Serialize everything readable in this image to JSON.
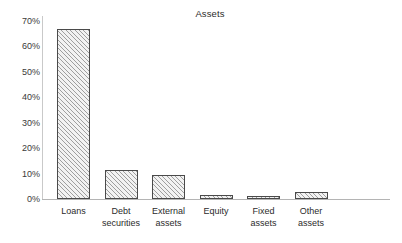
{
  "chart_data": {
    "type": "bar",
    "title": "Assets",
    "xlabel": "",
    "ylabel": "",
    "ylim": [
      0,
      70
    ],
    "ytick_labels": [
      "70%",
      "60%",
      "50%",
      "40%",
      "30%",
      "20%",
      "10%",
      "0%"
    ],
    "ytick_values": [
      70,
      60,
      50,
      40,
      30,
      20,
      10,
      0
    ],
    "grid": false,
    "legend": "none",
    "categories": [
      "Loans",
      "Debt securities",
      "External assets",
      "Equity",
      "Fixed assets",
      "Other assets"
    ],
    "category_lines": [
      [
        "Loans",
        ""
      ],
      [
        "Debt",
        "securities"
      ],
      [
        "External",
        "assets"
      ],
      [
        "Equity",
        ""
      ],
      [
        "Fixed",
        "assets"
      ],
      [
        "Other",
        "assets"
      ]
    ],
    "values": [
      67,
      11.5,
      9.5,
      1.5,
      1,
      2.7
    ],
    "value_unit": "%",
    "series": [
      {
        "name": "Assets",
        "values": [
          67,
          11.5,
          9.5,
          1.5,
          1,
          2.7
        ]
      }
    ],
    "colors": {
      "bar_fill": "#f2f2f2",
      "bar_hatch": "#5a5a5a",
      "bar_border": "#4a4a4a",
      "axis": "#b4b4b4",
      "y_axis": "#c9c9c9",
      "text": "#2b2b2b",
      "background": "#ffffff"
    }
  }
}
